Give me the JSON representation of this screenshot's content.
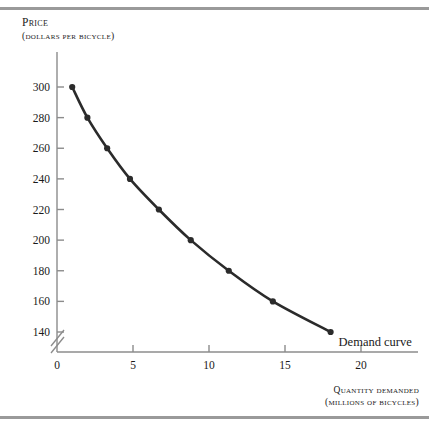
{
  "figure": {
    "background_color": "#ffffff",
    "frame_color": "#9a9a9a",
    "curve_color": "#2b2b2b",
    "axis_color": "#8c8c8c",
    "text_color": "#1a1a1a"
  },
  "y_axis": {
    "title_line1": "Price",
    "title_line2": "(dollars per bicycle)",
    "ticks": [
      300,
      280,
      260,
      240,
      220,
      200,
      180,
      160,
      140
    ],
    "tick_labels": [
      "300",
      "280",
      "260",
      "240",
      "220",
      "200",
      "180",
      "160",
      "140"
    ],
    "has_axis_break": true,
    "axis_break_symbol": "//"
  },
  "x_axis": {
    "title_line1": "Quantity demanded",
    "title_line2": "(millions of bicycles)",
    "ticks": [
      0,
      5,
      10,
      15,
      20
    ],
    "tick_labels": [
      "0",
      "5",
      "10",
      "15",
      "20"
    ]
  },
  "annotations": {
    "curve_label": "Demand curve"
  },
  "chart_data": {
    "type": "line",
    "title": "",
    "subtitle": "",
    "xlabel": "Quantity demanded (millions of bicycles)",
    "ylabel": "Price (dollars per bicycle)",
    "xlim": [
      0,
      22
    ],
    "ylim": [
      130,
      310
    ],
    "grid": false,
    "legend_position": "inline-annotation",
    "series": [
      {
        "name": "Demand curve",
        "marker": "filled-circle",
        "color": "#2b2b2b",
        "x": [
          1.0,
          2.0,
          3.3,
          4.8,
          6.7,
          8.8,
          11.3,
          14.2,
          18.0
        ],
        "y": [
          300,
          280,
          260,
          240,
          220,
          200,
          180,
          160,
          140
        ],
        "points": [
          {
            "quantity": 1.0,
            "price": 300
          },
          {
            "quantity": 2.0,
            "price": 280
          },
          {
            "quantity": 3.3,
            "price": 260
          },
          {
            "quantity": 4.8,
            "price": 240
          },
          {
            "quantity": 6.7,
            "price": 220
          },
          {
            "quantity": 8.8,
            "price": 200
          },
          {
            "quantity": 11.3,
            "price": 180
          },
          {
            "quantity": 14.2,
            "price": 160
          },
          {
            "quantity": 18.0,
            "price": 140
          }
        ]
      }
    ],
    "annotations": [
      {
        "text": "Demand curve",
        "x": 18.5,
        "y": 138
      }
    ]
  }
}
